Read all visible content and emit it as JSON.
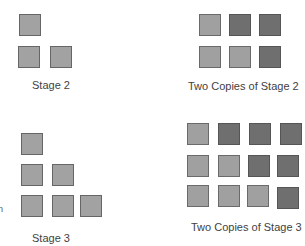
{
  "figures": {
    "stage2": {
      "label": "Stage 2",
      "squares": [
        {
          "x": 19,
          "y": 14,
          "shade": "plain"
        },
        {
          "x": 18,
          "y": 46,
          "shade": "plain"
        },
        {
          "x": 50,
          "y": 46,
          "shade": "plain"
        }
      ]
    },
    "two_copies_stage2": {
      "label": "Two Copies of Stage 2",
      "squares": [
        {
          "x": 199,
          "y": 14,
          "shade": "light"
        },
        {
          "x": 229,
          "y": 14,
          "shade": "dark"
        },
        {
          "x": 259,
          "y": 14,
          "shade": "dark"
        },
        {
          "x": 199,
          "y": 46,
          "shade": "light"
        },
        {
          "x": 229,
          "y": 46,
          "shade": "light"
        },
        {
          "x": 259,
          "y": 46,
          "shade": "dark"
        }
      ]
    },
    "stage3": {
      "label": "Stage 3",
      "squares": [
        {
          "x": 21,
          "y": 133,
          "shade": "plain"
        },
        {
          "x": 21,
          "y": 164,
          "shade": "plain"
        },
        {
          "x": 52,
          "y": 164,
          "shade": "plain"
        },
        {
          "x": 21,
          "y": 195,
          "shade": "plain"
        },
        {
          "x": 52,
          "y": 195,
          "shade": "plain"
        },
        {
          "x": 80,
          "y": 195,
          "shade": "plain"
        }
      ]
    },
    "two_copies_stage3": {
      "label": "Two Copies of Stage 3",
      "squares": [
        {
          "x": 187,
          "y": 123,
          "shade": "light"
        },
        {
          "x": 218,
          "y": 123,
          "shade": "dark"
        },
        {
          "x": 249,
          "y": 123,
          "shade": "dark"
        },
        {
          "x": 280,
          "y": 123,
          "shade": "dark"
        },
        {
          "x": 187,
          "y": 155,
          "shade": "light"
        },
        {
          "x": 218,
          "y": 155,
          "shade": "light"
        },
        {
          "x": 248,
          "y": 155,
          "shade": "dark"
        },
        {
          "x": 277,
          "y": 155,
          "shade": "dark"
        },
        {
          "x": 187,
          "y": 185,
          "shade": "light"
        },
        {
          "x": 218,
          "y": 185,
          "shade": "light"
        },
        {
          "x": 247,
          "y": 185,
          "shade": "light"
        },
        {
          "x": 277,
          "y": 187,
          "shade": "dark"
        }
      ]
    }
  },
  "edge_fragment": "n",
  "colors": {
    "plain": "#a2a2a2",
    "light": "#a0a0a0",
    "dark": "#6f6f6f",
    "text": "#3f3f3f"
  }
}
